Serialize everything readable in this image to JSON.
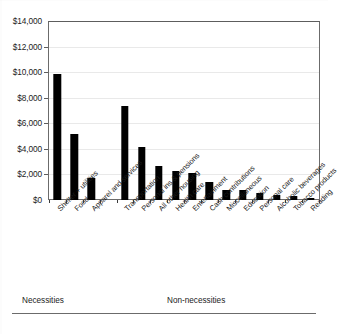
{
  "chart_data": {
    "type": "bar",
    "title": "",
    "xlabel": "",
    "ylabel": "",
    "ylim": [
      0,
      14000
    ],
    "grid": true,
    "legend": "none",
    "orientation": "vertical",
    "bar_color": "#000000",
    "y_ticks": [
      "$0",
      "$2,000",
      "$4,000",
      "$6,000",
      "$8,000",
      "$10,000",
      "$12,000",
      "$14,000"
    ],
    "y_tick_values": [
      0,
      2000,
      4000,
      6000,
      8000,
      10000,
      12000,
      14000
    ],
    "categories": [
      "Shelter + utilities",
      "Food",
      "Apparel and services",
      "Transportation",
      "Personal ins & pensions",
      "All other housing",
      "Health care",
      "Entertainment",
      "Cash contributions",
      "Miscellaneous",
      "Education",
      "Personal care",
      "Alcoholic beverages",
      "Tobacco products",
      "Reading"
    ],
    "values": [
      9900,
      5200,
      1700,
      7400,
      4200,
      2700,
      2300,
      2100,
      1400,
      800,
      750,
      550,
      400,
      330,
      120
    ],
    "annotations": [
      {
        "text": "Necessities",
        "group": "necessities"
      },
      {
        "text": "Non-necessities",
        "group": "non-necessities"
      }
    ]
  },
  "groups": {
    "necessities_label": "Necessities",
    "non_necessities_label": "Non-necessities"
  }
}
